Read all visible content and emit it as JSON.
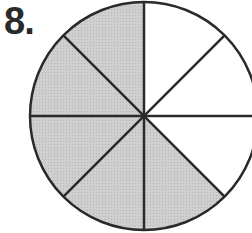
{
  "problem": {
    "number_label": "8."
  },
  "diagram": {
    "type": "fraction-circle",
    "total_parts": 8,
    "shaded_parts": 6,
    "shaded_sectors": [
      "top-left-upper",
      "top-left-lower",
      "bottom-left-upper",
      "bottom-left-lower",
      "bottom-right-lower",
      "bottom-right-upper-inner"
    ],
    "colors": {
      "shaded": "#c8c8c8",
      "unshaded": "#ffffff",
      "stroke": "#2a2a2a"
    }
  }
}
